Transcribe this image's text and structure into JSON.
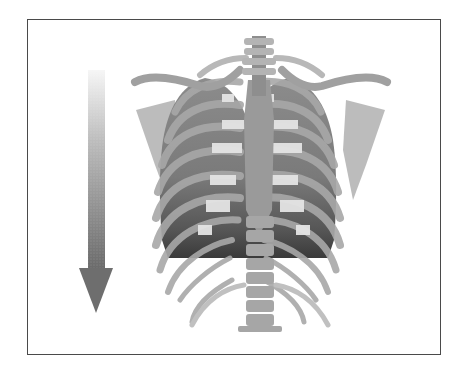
{
  "figure": {
    "arrow": {
      "direction": "down",
      "gradient_top_color": "#f2f2f2",
      "gradient_bottom_color": "#6a6a6a"
    },
    "colors": {
      "frame_border": "#4a4a4a",
      "bone": "#b5b5b5",
      "bone_light": "#d8d8d8",
      "lung": "#8a8a8a",
      "lung_dark": "#3e3e3e",
      "cartilage": "#e6e6e6"
    }
  }
}
